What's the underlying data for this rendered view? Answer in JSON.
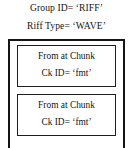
{
  "header": {
    "group_id_line": "Group ID= ‘RIFF’",
    "riff_type_line": "Riff Type= ‘WAVE’"
  },
  "outer_container": {
    "label": "RIFF WAVE container"
  },
  "chunks": [
    {
      "title": "From at Chunk",
      "ck_id": "Ck ID=  ‘fmt’"
    },
    {
      "title": "From at Chunk",
      "ck_id": "Ck ID=  ‘fmt’"
    }
  ],
  "colors": {
    "background": "#ffffff",
    "text": "#151515",
    "outer_border": "#151515",
    "chunk_border": "#1d1d1d"
  }
}
